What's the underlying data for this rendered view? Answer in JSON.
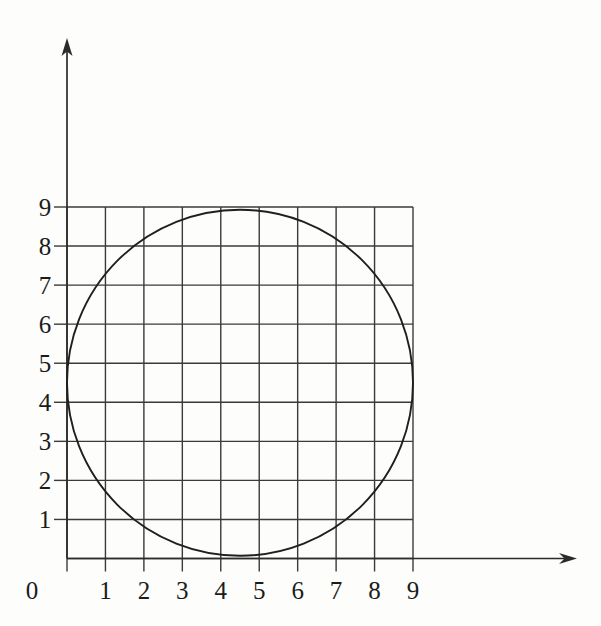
{
  "figure": {
    "title": "",
    "background_color": "#fdfdfb",
    "line_color": "#3a3a3a",
    "axis_color": "#2b2b2b",
    "curve_color": "#1f1f1f"
  },
  "chart_data": {
    "type": "scatter",
    "title": "",
    "xlabel": "",
    "ylabel": "",
    "xlim": [
      0,
      9
    ],
    "ylim": [
      0,
      9
    ],
    "grid": true,
    "legend": null,
    "x_tick_labels": [
      "0",
      "1",
      "2",
      "3",
      "4",
      "5",
      "6",
      "7",
      "8",
      "9"
    ],
    "y_tick_labels": [
      "1",
      "2",
      "3",
      "4",
      "5",
      "6",
      "7",
      "8",
      "9"
    ],
    "x_ticks": [
      0,
      1,
      2,
      3,
      4,
      5,
      6,
      7,
      8,
      9
    ],
    "y_ticks": [
      1,
      2,
      3,
      4,
      5,
      6,
      7,
      8,
      9
    ],
    "grid_x_lines": [
      0,
      1,
      2,
      3,
      4,
      5,
      6,
      7,
      8,
      9
    ],
    "grid_y_lines": [
      0,
      1,
      2,
      3,
      4,
      5,
      6,
      7,
      8,
      9
    ],
    "annotations": [],
    "series": [
      {
        "name": "circle",
        "shape": "circle",
        "center": [
          4.5,
          4.5
        ],
        "radius": 4.5,
        "values": []
      }
    ]
  },
  "axes": {
    "x_axis_name": "x-axis",
    "y_axis_name": "y-axis",
    "x_arrow": "right-arrow-icon",
    "y_arrow": "up-arrow-icon"
  },
  "labels": {
    "x": [
      "0",
      "1",
      "2",
      "3",
      "4",
      "5",
      "6",
      "7",
      "8",
      "9"
    ],
    "y": [
      "9",
      "8",
      "7",
      "6",
      "5",
      "4",
      "3",
      "2",
      "1"
    ]
  }
}
